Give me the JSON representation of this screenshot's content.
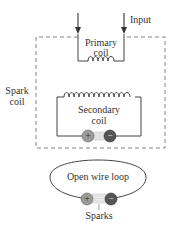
{
  "diagram": {
    "labels": {
      "input": "Input",
      "primary_coil_line1": "Primary",
      "primary_coil_line2": "coil",
      "spark_coil_line1": "Spark",
      "spark_coil_line2": "coil",
      "secondary_coil_line1": "Secondary",
      "secondary_coil_line2": "coil",
      "open_wire_loop": "Open wire loop",
      "sparks": "Sparks"
    },
    "terminals": {
      "positive": "+",
      "negative": "−"
    },
    "colors": {
      "line": "#444444",
      "dash": "#777777",
      "positive_terminal": "#9a9a9a",
      "negative_terminal": "#555555"
    }
  }
}
